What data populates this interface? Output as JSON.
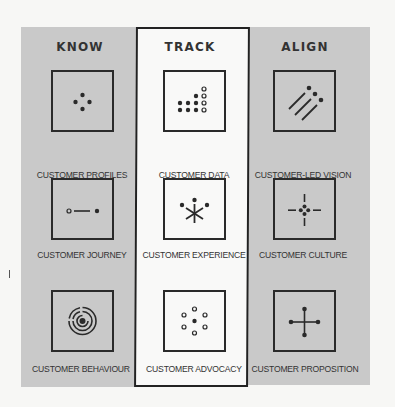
{
  "columns": [
    {
      "heading": "KNOW",
      "style": "gray"
    },
    {
      "heading": "TRACK",
      "style": "outlined-white"
    },
    {
      "heading": "ALIGN",
      "style": "gray"
    }
  ],
  "cells": {
    "know": [
      {
        "label": "CUSTOMER PROFILES",
        "icon": "four-dots-icon"
      },
      {
        "label": "CUSTOMER JOURNEY",
        "icon": "journey-line-icon"
      },
      {
        "label": "CUSTOMER BEHAVIOUR",
        "icon": "concentric-target-icon"
      }
    ],
    "track": [
      {
        "label": "CUSTOMER DATA",
        "icon": "dot-grid-chart-icon"
      },
      {
        "label": "CUSTOMER EXPERIENCE",
        "icon": "asterisk-dots-icon"
      },
      {
        "label": "CUSTOMER ADVOCACY",
        "icon": "ring-of-circles-icon"
      }
    ],
    "align": [
      {
        "label": "CUSTOMER-LED VISION",
        "icon": "diagonal-lines-dots-icon"
      },
      {
        "label": "CUSTOMER CULTURE",
        "icon": "crosshair-icon"
      },
      {
        "label": "CUSTOMER PROPOSITION",
        "icon": "cross-dots-icon"
      }
    ]
  },
  "colors": {
    "panel_gray": "#c9c9c9",
    "background": "#f7f7f5",
    "ink": "#2a2a2a"
  }
}
